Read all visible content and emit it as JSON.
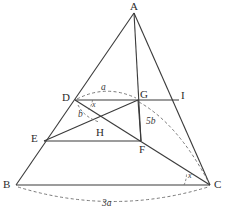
{
  "figure": {
    "type": "geometry-diagram",
    "width": 229,
    "height": 219,
    "background_color": "#ffffff",
    "stroke_color": "#3a3a3a",
    "dash_color": "#6b6b6b"
  },
  "vertices": [
    {
      "id": "A",
      "label": "A",
      "x": 134,
      "y": 13,
      "label_x": 130,
      "label_y": 2
    },
    {
      "id": "B",
      "label": "B",
      "x": 16,
      "y": 185,
      "label_x": 4,
      "label_y": 180
    },
    {
      "id": "C",
      "label": "C",
      "x": 210,
      "y": 185,
      "label_x": 213,
      "label_y": 180
    },
    {
      "id": "D",
      "label": "D",
      "x": 75,
      "y": 100,
      "label_x": 62,
      "label_y": 93
    },
    {
      "id": "E",
      "label": "E",
      "x": 44,
      "y": 141,
      "label_x": 31,
      "label_y": 135
    },
    {
      "id": "F",
      "label": "F",
      "x": 141,
      "y": 141,
      "label_x": 139,
      "label_y": 145
    },
    {
      "id": "G",
      "label": "G",
      "x": 138,
      "y": 100,
      "label_x": 140,
      "label_y": 90
    },
    {
      "id": "H",
      "label": "H",
      "x": 100,
      "y": 125,
      "label_x": 97,
      "label_y": 128
    },
    {
      "id": "I",
      "label": "I",
      "x": 179,
      "y": 100,
      "label_x": 181,
      "label_y": 91
    }
  ],
  "segments": [
    {
      "name": "segment-AB",
      "from": "A",
      "to": "B",
      "style": "solid"
    },
    {
      "name": "segment-AC",
      "from": "A",
      "to": "C",
      "style": "solid"
    },
    {
      "name": "segment-AF",
      "from": "A",
      "to": "F",
      "style": "solid"
    },
    {
      "name": "segment-BC",
      "from": "B",
      "to": "C",
      "style": "solid"
    },
    {
      "name": "segment-DI",
      "from": "D",
      "to": "I",
      "style": "solid"
    },
    {
      "name": "segment-EF",
      "from": "E",
      "to": "F",
      "style": "solid"
    },
    {
      "name": "segment-DC",
      "from": "D",
      "to": "C",
      "style": "solid"
    },
    {
      "name": "segment-GE",
      "from": "G",
      "to": "E",
      "style": "solid"
    },
    {
      "name": "segment-GF",
      "from": "G",
      "to": "F",
      "style": "solid"
    }
  ],
  "arcs": [
    {
      "name": "arc-a-D-G",
      "label": "a",
      "from": "D",
      "to": "G",
      "style": "dashed",
      "label_x": 102,
      "label_y": 88,
      "path": "M 77 99 Q 106 84 136 98"
    },
    {
      "name": "arc-5b-G-C",
      "label": "5b",
      "from": "G",
      "to": "C",
      "style": "dashed",
      "label_x": 147,
      "label_y": 122,
      "path": "M 139 102 Q 178 124 209 183"
    },
    {
      "name": "arc-3a-B-C",
      "label": "3a",
      "from": "B",
      "to": "C",
      "style": "dashed",
      "label_x": 105,
      "label_y": 204,
      "path": "M 18 187 Q 113 216 208 187"
    },
    {
      "name": "arc-b-D-H",
      "label": "b",
      "from": "D",
      "to": "H",
      "style": "dashed",
      "label_x": 80,
      "label_y": 115,
      "path": "M 77 104 Q 83 116 99 122"
    }
  ],
  "angles": [
    {
      "name": "angle-x-at-D",
      "label": "x",
      "vertex": "D",
      "label_x": 93,
      "label_y": 104,
      "arc_path": "M 93 100 A 18 18 0 0 1 89 110"
    },
    {
      "name": "angle-x-at-C",
      "label": "x",
      "vertex": "C",
      "label_x": 189,
      "label_y": 174,
      "arc_path": "M 184 185 A 26 26 0 0 0 187 174"
    }
  ],
  "labels": {
    "a": "a",
    "b": "b",
    "five_b": "5b",
    "three_a": "3a",
    "x": "x"
  }
}
